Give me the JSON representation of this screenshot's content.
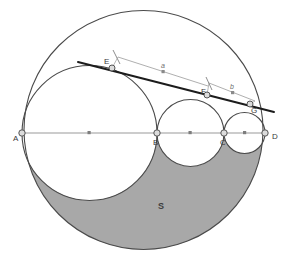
{
  "figure": {
    "background_color": "#ffffff",
    "stroke_color": "#4a4a4a",
    "thin_stroke_color": "#9a9a9a",
    "shade_color": "#a8a8a8",
    "shade_stroke_color": "#6b6b6b",
    "tangent_color": "#1c1c1c",
    "node_fill": "#d9d9d9",
    "node_stroke": "#555555",
    "width": 289,
    "height": 257
  },
  "points": [
    {
      "id": "A",
      "label": "A",
      "x": 22,
      "y": 133,
      "label_x": 13,
      "label_y": 141,
      "node": true
    },
    {
      "id": "B",
      "label": "B",
      "x": 157,
      "y": 133,
      "label_x": 153,
      "label_y": 145,
      "node": true
    },
    {
      "id": "C",
      "label": "C",
      "x": 224,
      "y": 133,
      "label_x": 220,
      "label_y": 145,
      "node": true
    },
    {
      "id": "D",
      "label": "D",
      "x": 265,
      "y": 133,
      "label_x": 272,
      "label_y": 139,
      "node": true
    },
    {
      "id": "E",
      "label": "E",
      "x": 112,
      "y": 68,
      "label_x": 104,
      "label_y": 62,
      "node": true
    },
    {
      "id": "F",
      "label": "F",
      "x": 207,
      "y": 95,
      "label_x": 202,
      "label_y": 92,
      "node": true
    },
    {
      "id": "G",
      "label": "G",
      "x": 250,
      "y": 104,
      "label_x": 251,
      "label_y": 112,
      "node": true
    }
  ],
  "midpoint_marks": [
    {
      "id": "mid-A-B-axis",
      "x": 90,
      "y": 133
    },
    {
      "id": "mid-B-C-axis",
      "x": 190,
      "y": 133
    },
    {
      "id": "mid-C-D-axis",
      "x": 245,
      "y": 133
    },
    {
      "id": "mid-measure-a",
      "x": 163,
      "y": 72
    },
    {
      "id": "mid-measure-b",
      "x": 232,
      "y": 93
    }
  ],
  "circles": [
    {
      "id": "circle-AD",
      "name": "outer-semicircle-AD",
      "cx": 143.5,
      "cy": 130.0,
      "r": 119.5,
      "filled": false
    },
    {
      "id": "circle-AB",
      "name": "inner-circle-AB",
      "cx": 89.5,
      "cy": 133,
      "r": 67.5,
      "filled": false
    },
    {
      "id": "circle-BC",
      "name": "inner-circle-BC",
      "cx": 190.5,
      "cy": 133,
      "r": 33.5,
      "filled": false
    },
    {
      "id": "circle-CD",
      "name": "inner-circle-CD",
      "cx": 244.5,
      "cy": 133,
      "r": 20.5,
      "filled": false
    }
  ],
  "axis": {
    "id": "diameter-AD",
    "x1": 22,
    "y1": 133,
    "x2": 265,
    "y2": 133
  },
  "tangent_line": {
    "id": "tangent-E-G",
    "x1": 78,
    "y1": 62,
    "x2": 274,
    "y2": 112,
    "label": ""
  },
  "measure_segments": [
    {
      "id": "measure-a",
      "label": "a",
      "x1": 118,
      "y1": 57,
      "x2": 208,
      "y2": 86,
      "label_x": 161,
      "label_y": 69,
      "tick_x": 118,
      "tick_y": 57
    },
    {
      "id": "measure-b",
      "label": "b",
      "x1": 209,
      "y1": 83,
      "x2": 255,
      "y2": 101,
      "label_x": 231,
      "label_y": 90,
      "tick_x": 209,
      "tick_y": 83
    }
  ],
  "shaded_region": {
    "id": "region-S",
    "label": "S",
    "label_x": 160,
    "label_y": 208,
    "fill": "#a8a8a8"
  }
}
